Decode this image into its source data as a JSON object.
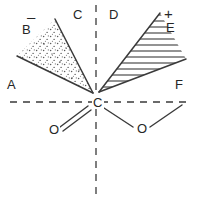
{
  "figure": {
    "center_atom": "C",
    "labels": {
      "region_a": "A",
      "region_b": "B",
      "region_c": "C",
      "region_d": "D",
      "region_e": "E",
      "region_f": "F",
      "minus_sign": "–",
      "plus_sign": "+",
      "oxygen_double": "O",
      "oxygen_single": "O"
    },
    "colors": {
      "stroke": "#3a3a3a",
      "text": "#262626",
      "background": "#ffffff",
      "stipple": "#5a5a5a"
    },
    "geometry": {
      "center": [
        96,
        102
      ],
      "axis_horizontal_y": 102,
      "axis_vertical_x": 96,
      "lobe_negative_vertices": [
        [
          93,
          93
        ],
        [
          55,
          19
        ],
        [
          17,
          56
        ]
      ],
      "lobe_positive_vertices": [
        [
          99,
          92
        ],
        [
          160,
          13
        ],
        [
          186,
          59
        ]
      ]
    },
    "annotations": {
      "negative_lobe_fill": "stipple",
      "positive_lobe_fill": "horizontal-hatch",
      "axes_style": "dashed",
      "bond_left": "double",
      "bond_right": "single"
    }
  }
}
